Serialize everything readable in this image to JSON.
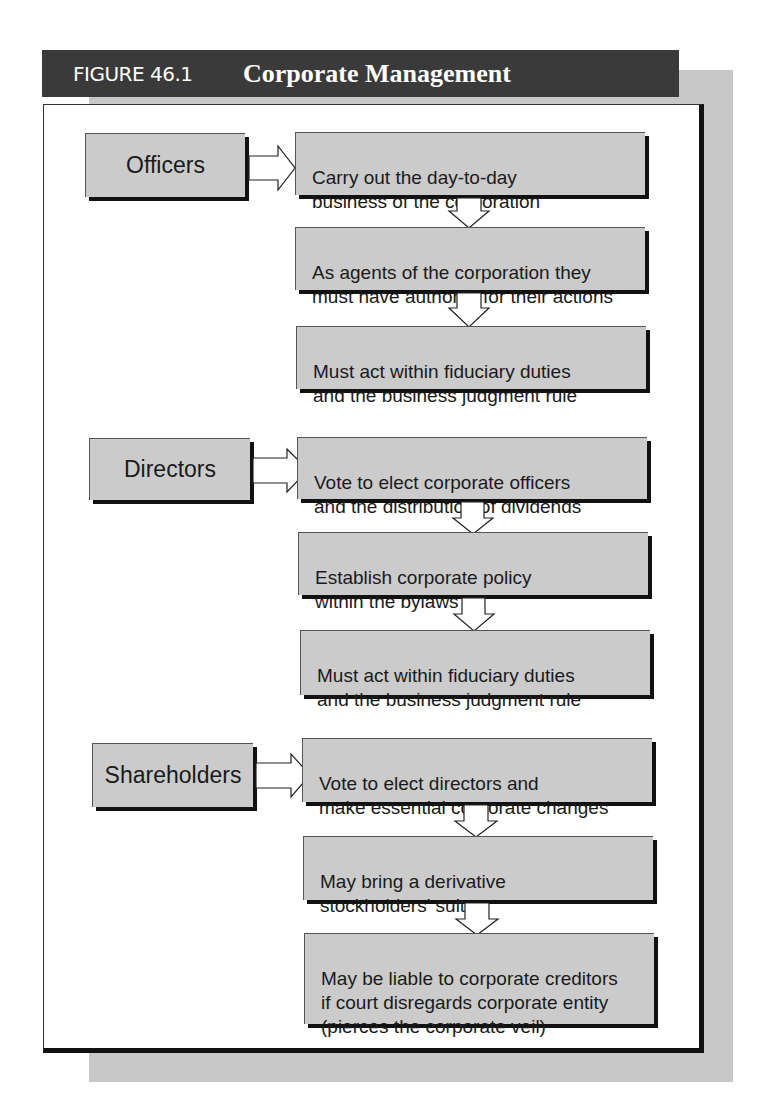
{
  "figure": {
    "number": "FIGURE 46.1",
    "title": "Corporate Management"
  },
  "colors": {
    "header_bg": "#3a3a3a",
    "box_fill": "#cbcbcb",
    "shadow": "#c7c7c7"
  },
  "sections": [
    {
      "label": "Officers",
      "steps": [
        "Carry out the day-to-day\nbusiness of the corporation",
        "As agents of the corporation they\nmust have authority for their actions",
        "Must act within fiduciary duties\nand the business judgment rule"
      ]
    },
    {
      "label": "Directors",
      "steps": [
        "Vote to elect corporate officers\nand the distribution of dividends",
        "Establish corporate policy\nwithin the bylaws",
        "Must act within fiduciary duties\nand the business judgment rule"
      ]
    },
    {
      "label": "Shareholders",
      "steps": [
        "Vote to elect directors and\nmake essential corporate changes",
        "May bring a derivative\nstockholders' suit",
        "May be liable to corporate creditors\nif court disregards corporate entity\n(pierces the corporate veil)"
      ]
    }
  ]
}
